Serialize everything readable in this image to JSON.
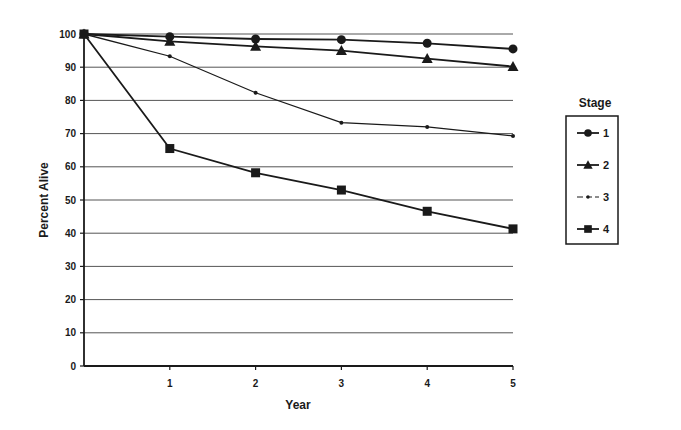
{
  "chart_data": {
    "type": "line",
    "title": "",
    "xlabel": "Year",
    "ylabel": "Percent Alive",
    "x": [
      0,
      1,
      2,
      3,
      4,
      5
    ],
    "x_tick_labels": [
      "1",
      "2",
      "3",
      "4",
      "5"
    ],
    "y_tick_labels": [
      "0",
      "10",
      "20",
      "30",
      "40",
      "50",
      "60",
      "70",
      "80",
      "90",
      "100"
    ],
    "xlim": [
      0,
      5
    ],
    "ylim": [
      0,
      100
    ],
    "grid": {
      "horizontal": true,
      "vertical": false
    },
    "legend": {
      "title": "Stage",
      "position": "right"
    },
    "series": [
      {
        "name": "1",
        "marker": "circle",
        "values": [
          100,
          99.2,
          98.5,
          98.3,
          97.2,
          95.5
        ]
      },
      {
        "name": "2",
        "marker": "triangle",
        "values": [
          100,
          97.8,
          96.3,
          95.0,
          92.6,
          90.2
        ]
      },
      {
        "name": "3",
        "marker": "dot",
        "values": [
          100,
          93.3,
          82.3,
          73.3,
          72.0,
          69.3
        ]
      },
      {
        "name": "4",
        "marker": "square",
        "values": [
          100,
          65.5,
          58.2,
          53.0,
          46.6,
          41.3
        ]
      }
    ],
    "colors": {
      "line": "#1a1a1a",
      "grid": "#555555",
      "background": "#ffffff"
    }
  }
}
